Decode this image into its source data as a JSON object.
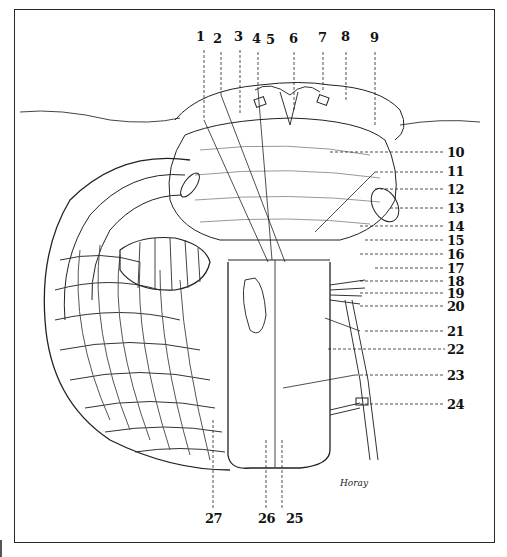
{
  "figure": {
    "signature": "Horay",
    "colors": {
      "ink": "#111111",
      "paper": "#ffffff",
      "frame": "#2a2a2a"
    }
  },
  "labels": {
    "top": [
      {
        "n": "1",
        "x": 200,
        "y": 33
      },
      {
        "n": "2",
        "x": 217,
        "y": 35
      },
      {
        "n": "3",
        "x": 236,
        "y": 33
      },
      {
        "n": "4",
        "x": 254,
        "y": 35
      },
      {
        "n": "5",
        "x": 268,
        "y": 36
      },
      {
        "n": "6",
        "x": 289,
        "y": 35
      },
      {
        "n": "7",
        "x": 318,
        "y": 34
      },
      {
        "n": "8",
        "x": 341,
        "y": 33
      },
      {
        "n": "9",
        "x": 370,
        "y": 34
      }
    ],
    "right": [
      {
        "n": "10",
        "x": 447,
        "y": 147
      },
      {
        "n": "11",
        "x": 447,
        "y": 166
      },
      {
        "n": "12",
        "x": 447,
        "y": 184
      },
      {
        "n": "13",
        "x": 447,
        "y": 203
      },
      {
        "n": "14",
        "x": 447,
        "y": 221
      },
      {
        "n": "15",
        "x": 447,
        "y": 235
      },
      {
        "n": "16",
        "x": 447,
        "y": 249
      },
      {
        "n": "17",
        "x": 447,
        "y": 263
      },
      {
        "n": "18",
        "x": 447,
        "y": 276
      },
      {
        "n": "19",
        "x": 447,
        "y": 288
      },
      {
        "n": "20",
        "x": 447,
        "y": 301
      },
      {
        "n": "21",
        "x": 447,
        "y": 326
      },
      {
        "n": "22",
        "x": 447,
        "y": 344
      },
      {
        "n": "23",
        "x": 447,
        "y": 370
      },
      {
        "n": "24",
        "x": 447,
        "y": 399
      }
    ],
    "bottom": [
      {
        "n": "27",
        "x": 205,
        "y": 513
      },
      {
        "n": "26",
        "x": 258,
        "y": 513
      },
      {
        "n": "25",
        "x": 286,
        "y": 513
      }
    ]
  }
}
